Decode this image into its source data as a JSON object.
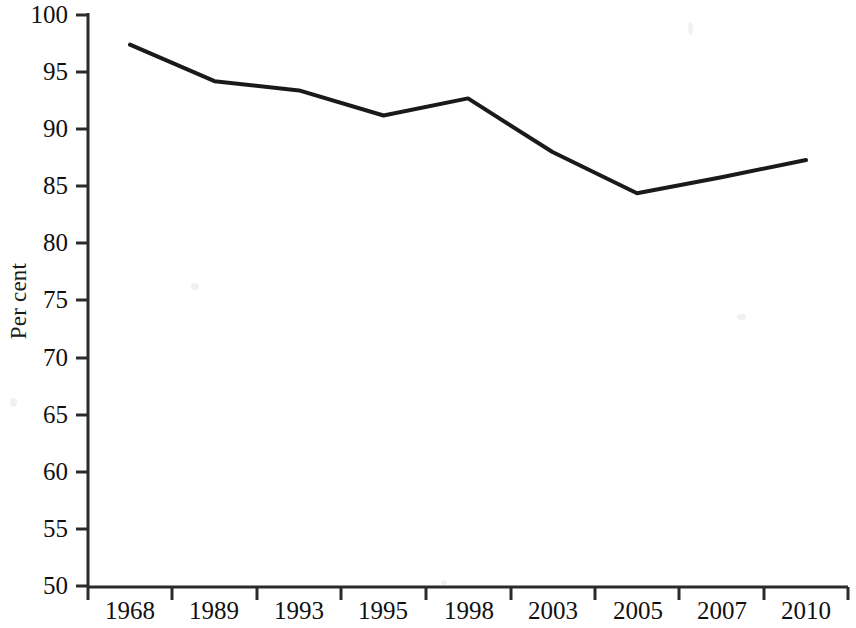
{
  "chart_data": {
    "type": "line",
    "title": "",
    "subtitle": "",
    "xlabel": "",
    "ylabel": "Per cent",
    "categories": [
      "1968",
      "1989",
      "1993",
      "1995",
      "1998",
      "2003",
      "2005",
      "2007",
      "2010"
    ],
    "values": [
      97.4,
      94.2,
      93.4,
      91.2,
      92.7,
      88.0,
      84.4,
      85.8,
      87.3
    ],
    "series": [
      {
        "name": "Per cent",
        "values": [
          97.4,
          94.2,
          93.4,
          91.2,
          92.7,
          88.0,
          84.4,
          85.8,
          87.3
        ]
      }
    ],
    "ylim": [
      50,
      100
    ],
    "ytick_labels": [
      "100",
      "95",
      "90",
      "85",
      "80",
      "75",
      "70",
      "65",
      "60",
      "55",
      "50"
    ],
    "ytick_values": [
      100,
      95,
      90,
      85,
      80,
      75,
      70,
      65,
      60,
      55,
      50
    ],
    "ytick_step": 5,
    "xtick_labels": [
      "1968",
      "1989",
      "1993",
      "1995",
      "1998",
      "2003",
      "2005",
      "2007",
      "2010"
    ],
    "grid": false,
    "legend": null,
    "legend_position": "none",
    "line_color": "#1a1a1a",
    "line_width": 4,
    "markers": false,
    "axis_color": "#2b2b2b",
    "background_color": "#ffffff"
  },
  "axes": {
    "y_axis_label": "Per cent",
    "y_ticks": [
      {
        "label": "100",
        "value": 100
      },
      {
        "label": "95",
        "value": 95
      },
      {
        "label": "90",
        "value": 90
      },
      {
        "label": "85",
        "value": 85
      },
      {
        "label": "80",
        "value": 80
      },
      {
        "label": "75",
        "value": 75
      },
      {
        "label": "70",
        "value": 70
      },
      {
        "label": "65",
        "value": 65
      },
      {
        "label": "60",
        "value": 60
      },
      {
        "label": "55",
        "value": 55
      },
      {
        "label": "50",
        "value": 50
      }
    ],
    "x_ticks": [
      {
        "label": "1968"
      },
      {
        "label": "1989"
      },
      {
        "label": "1993"
      },
      {
        "label": "1995"
      },
      {
        "label": "1998"
      },
      {
        "label": "2003"
      },
      {
        "label": "2005"
      },
      {
        "label": "2007"
      },
      {
        "label": "2010"
      }
    ]
  }
}
